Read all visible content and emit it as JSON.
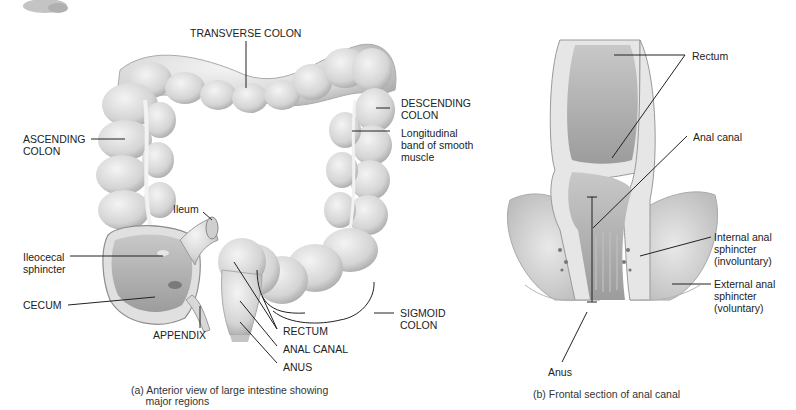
{
  "panel_a": {
    "labels": {
      "transverse_colon": "TRANSVERSE COLON",
      "descending_colon": "DESCENDING\nCOLON",
      "longitudinal_band": "Longitudinal\nband of smooth\nmuscle",
      "ascending_colon": "ASCENDING\nCOLON",
      "ileum": "Ileum",
      "ileocecal_sphincter": "Ileocecal\nsphincter",
      "cecum": "CECUM",
      "appendix": "APPENDIX",
      "rectum": "RECTUM",
      "anal_canal": "ANAL CANAL",
      "anus": "ANUS",
      "sigmoid_colon": "SIGMOID\nCOLON"
    },
    "caption": "(a) Anterior view of large intestine showing\n     major regions"
  },
  "panel_b": {
    "labels": {
      "rectum": "Rectum",
      "anal_canal": "Anal canal",
      "internal_sphincter": "Internal anal\nsphincter\n(involuntary)",
      "external_sphincter": "External anal\nsphincter\n(voluntary)",
      "anus": "Anus"
    },
    "caption": "(b) Frontal section of anal canal"
  },
  "colors": {
    "tissue_light": "#e4e4e4",
    "tissue_mid": "#cfcfcf",
    "tissue_dark": "#9a9a9a",
    "leader_line": "#222222"
  }
}
